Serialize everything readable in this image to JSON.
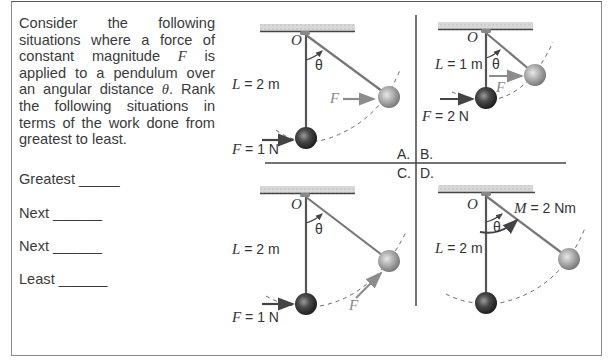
{
  "question": {
    "text_parts": [
      "Consider the following situations where a force of constant magnitude ",
      "F",
      " is applied to a pendulum over an angular distance ",
      "θ",
      ".  Rank the following situations in terms of the work done from greatest to least."
    ]
  },
  "ranking": [
    {
      "label": "Greatest",
      "blank": "_____"
    },
    {
      "label": "Next",
      "blank": "______"
    },
    {
      "label": "Next",
      "blank": "______"
    },
    {
      "label": "Least",
      "blank": "______"
    }
  ],
  "panels": {
    "A": {
      "letter": "A.",
      "pivot": "O",
      "length": "L = 2 m",
      "angle": "θ",
      "force_start": "F = 1 N",
      "force_end": "F"
    },
    "B": {
      "letter": "B.",
      "pivot": "O",
      "length": "L = 1 m",
      "angle": "θ",
      "force_start": "F = 2 N",
      "force_end": "F"
    },
    "C": {
      "letter": "C.",
      "pivot": "O",
      "length": "L = 2 m",
      "angle": "θ",
      "force_start": "F = 1 N",
      "force_end": "F"
    },
    "D": {
      "letter": "D.",
      "pivot": "O",
      "length": "L = 2 m",
      "angle": "θ",
      "moment": "M = 2 Nm"
    }
  },
  "colors": {
    "rod": "#555555",
    "dark_ball": "#3a3a3a",
    "light_ball": "#a8a8a8",
    "arrow_dark": "#444444",
    "arrow_light": "#8c8c8c",
    "divider": "#444444"
  }
}
